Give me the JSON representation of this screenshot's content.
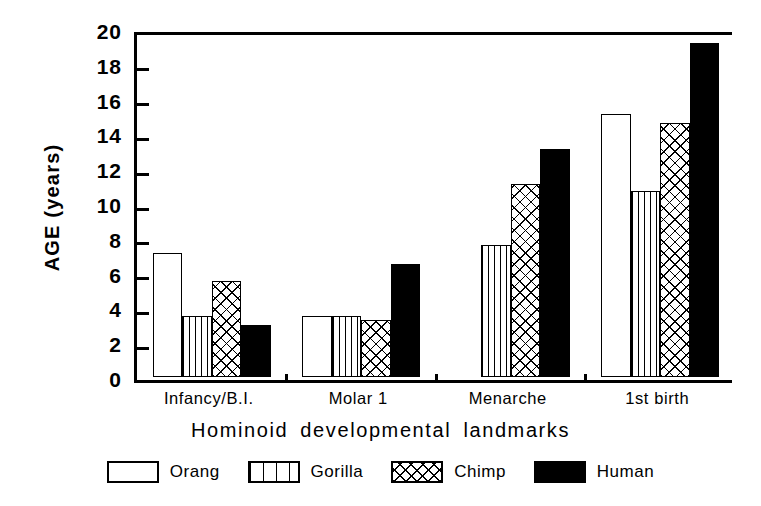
{
  "chart_data": {
    "type": "bar",
    "title": "",
    "xlabel": "Hominoid  developmental  landmarks",
    "ylabel": "AGE  (years)",
    "ylim": [
      0,
      20
    ],
    "yticks": [
      0,
      2,
      4,
      6,
      8,
      10,
      12,
      14,
      16,
      18,
      20
    ],
    "grid": false,
    "legend_position": "bottom",
    "categories": [
      "Infancy/B.I.",
      "Molar  1",
      "Menarche",
      "1st  birth"
    ],
    "series": [
      {
        "name": "Orang",
        "pattern": "open",
        "values": [
          7.1,
          3.5,
          null,
          15.1
        ]
      },
      {
        "name": "Gorilla",
        "pattern": "vertical",
        "values": [
          3.5,
          3.5,
          7.6,
          10.7
        ]
      },
      {
        "name": "Chimp",
        "pattern": "crosshatch",
        "values": [
          5.5,
          3.3,
          11.1,
          14.6
        ]
      },
      {
        "name": "Human",
        "pattern": "solid-black",
        "values": [
          3.0,
          6.5,
          13.1,
          19.2
        ]
      }
    ]
  },
  "axis": {
    "y_title": "AGE  (years)",
    "x_title": "Hominoid  developmental  landmarks",
    "y_tick_labels": [
      "20",
      "18",
      "16",
      "14",
      "12",
      "10",
      "8",
      "6",
      "4",
      "2",
      "0"
    ]
  },
  "legend": {
    "items": [
      {
        "label": "Orang",
        "pattern": "open"
      },
      {
        "label": "Gorilla",
        "pattern": "vertical"
      },
      {
        "label": "Chimp",
        "pattern": "crosshatch"
      },
      {
        "label": "Human",
        "pattern": "solid-black"
      }
    ]
  },
  "colors": {
    "ink": "#000000",
    "paper": "#ffffff"
  }
}
